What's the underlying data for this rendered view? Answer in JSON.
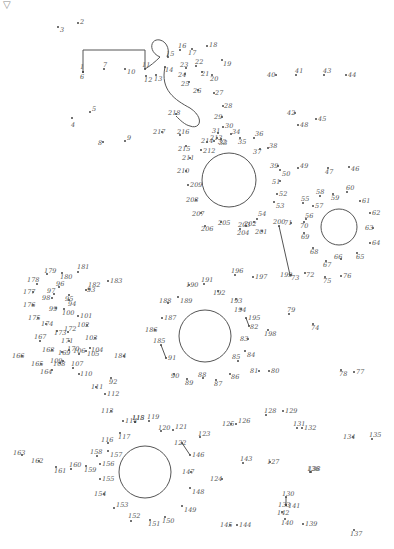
{
  "puzzle": {
    "type": "connect-the-dots",
    "corner_icon": "triangle-down-icon",
    "corner_glyph": "▽",
    "dots": [
      "1",
      "2",
      "3",
      "4",
      "5",
      "6",
      "7",
      "8",
      "9",
      "10",
      "11",
      "12",
      "13",
      "14",
      "15",
      "16",
      "17",
      "18",
      "19",
      "20",
      "21",
      "22",
      "23",
      "24",
      "25",
      "26",
      "27",
      "28",
      "29",
      "30",
      "31",
      "32",
      "33",
      "34",
      "35",
      "36",
      "37",
      "38",
      "39",
      "40",
      "41",
      "42",
      "43",
      "44",
      "45",
      "46",
      "47",
      "48",
      "49",
      "50",
      "51",
      "52",
      "53",
      "54",
      "55",
      "56",
      "57",
      "58",
      "59",
      "60",
      "61",
      "62",
      "63",
      "64",
      "65",
      "66",
      "67",
      "68",
      "69",
      "70",
      "71",
      "72",
      "73",
      "74",
      "75",
      "76",
      "77",
      "78",
      "79",
      "80",
      "81",
      "82",
      "83",
      "84",
      "85",
      "86",
      "87",
      "88",
      "89",
      "90",
      "91",
      "92",
      "93",
      "94",
      "95",
      "96",
      "97",
      "98",
      "99",
      "100",
      "101",
      "102",
      "103",
      "104",
      "105",
      "106",
      "107",
      "108",
      "109",
      "110",
      "111",
      "112",
      "113",
      "114",
      "115",
      "116",
      "117",
      "118",
      "119",
      "120",
      "121",
      "122",
      "123",
      "124",
      "125",
      "126",
      "127",
      "128",
      "129",
      "130",
      "131",
      "132",
      "133",
      "134",
      "135",
      "136",
      "137",
      "138",
      "139",
      "140",
      "141",
      "142",
      "143",
      "144",
      "145",
      "146",
      "147",
      "148",
      "149",
      "150",
      "151",
      "152",
      "153",
      "154",
      "155",
      "156",
      "157",
      "158",
      "159",
      "160",
      "161",
      "162",
      "163",
      "164",
      "165",
      "166",
      "167",
      "168",
      "169",
      "170",
      "171",
      "172",
      "173",
      "174",
      "175",
      "176",
      "177",
      "178",
      "179",
      "180",
      "181",
      "182",
      "183",
      "184",
      "185",
      "186",
      "187",
      "188",
      "189",
      "190",
      "191",
      "192",
      "193",
      "194",
      "195",
      "196",
      "197",
      "198",
      "199",
      "200",
      "201",
      "202",
      "203",
      "204",
      "205",
      "206",
      "207",
      "208",
      "209",
      "210",
      "211",
      "212",
      "213",
      "214",
      "215",
      "216",
      "217",
      "218"
    ]
  }
}
